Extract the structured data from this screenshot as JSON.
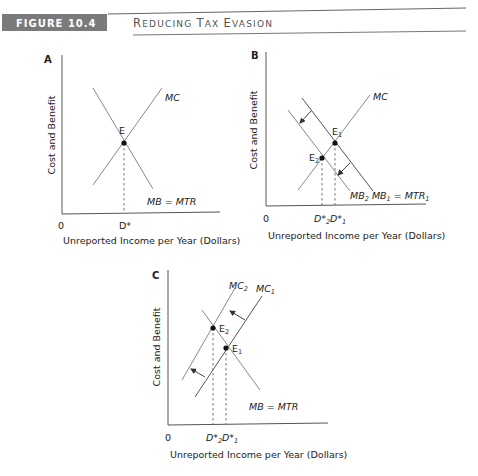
{
  "header": {
    "figure_label": "FIGURE 10.4",
    "title_parts": [
      {
        "text": "R",
        "size": "big"
      },
      {
        "text": "EDUCING ",
        "size": "small"
      },
      {
        "text": "T",
        "size": "big"
      },
      {
        "text": "AX ",
        "size": "small"
      },
      {
        "text": "E",
        "size": "big"
      },
      {
        "text": "VASION",
        "size": "small"
      }
    ],
    "title": "Reducing Tax Evasion",
    "label_bg_color": "#7a7a7a"
  },
  "panels": {
    "A": {
      "letter": "A",
      "ylabel": "Cost and Benefit",
      "xlabel": "Unreported Income per Year (Dollars)",
      "origin": "0",
      "point": "E",
      "xtick": "D*",
      "curve_mc": "MC",
      "curve_mb": "MB = MTR"
    },
    "B": {
      "letter": "B",
      "ylabel": "Cost and Benefit",
      "xlabel": "Unreported Income per Year (Dollars)",
      "origin": "0",
      "point1": "E",
      "point1_sub": "1",
      "point2": "E",
      "point2_sub": "2",
      "xtick2": "D*",
      "xtick2_sub": "2",
      "xtick1": "D*",
      "xtick1_sub": "1",
      "curve_mc": "MC",
      "curve_mb2": "MB",
      "curve_mb2_sub": "2",
      "curve_mb1": "MB",
      "curve_mb1_sub": "1",
      "curve_mtr": " = MTR",
      "curve_mtr_sub": "1"
    },
    "C": {
      "letter": "C",
      "ylabel": "Cost and Benefit",
      "xlabel": "Unreported Income per Year (Dollars)",
      "origin": "0",
      "point1": "E",
      "point1_sub": "1",
      "point2": "E",
      "point2_sub": "2",
      "xtick2": "D*",
      "xtick2_sub": "2",
      "xtick1": "D*",
      "xtick1_sub": "1",
      "curve_mc2": "MC",
      "curve_mc2_sub": "2",
      "curve_mc1": "MC",
      "curve_mc1_sub": "1",
      "curve_mb": "MB = MTR"
    }
  }
}
